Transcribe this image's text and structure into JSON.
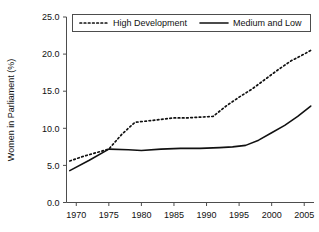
{
  "chart_data": {
    "type": "line",
    "title": "",
    "xlabel": "",
    "ylabel": "Women in Parliament (%)",
    "xlim": [
      1968.5,
      2006.5
    ],
    "ylim": [
      0.0,
      25.0
    ],
    "grid": false,
    "legend_position": "top",
    "x_ticks": [
      "1970",
      "1975",
      "1980",
      "1985",
      "1990",
      "1995",
      "2000",
      "2005"
    ],
    "x_tick_values": [
      1970,
      1975,
      1980,
      1985,
      1990,
      1995,
      2000,
      2005
    ],
    "y_ticks": [
      "0.0",
      "5.0",
      "10.0",
      "15.0",
      "20.0",
      "25.0"
    ],
    "y_tick_values": [
      0.0,
      5.0,
      10.0,
      15.0,
      20.0,
      25.0
    ],
    "series": [
      {
        "name": "High Development",
        "style": "dotted",
        "color": "#111111",
        "x": [
          1969,
          1971,
          1973,
          1975,
          1977,
          1979,
          1981,
          1983,
          1985,
          1987,
          1989,
          1991,
          1993,
          1995,
          1997,
          1999,
          2001,
          2003,
          2005,
          2006
        ],
        "values": [
          5.6,
          6.2,
          6.7,
          7.2,
          9.2,
          10.8,
          11.0,
          11.2,
          11.4,
          11.4,
          11.5,
          11.6,
          13.0,
          14.2,
          15.3,
          16.6,
          17.9,
          19.1,
          20.0,
          20.5
        ]
      },
      {
        "name": "Medium and Low",
        "style": "solid",
        "color": "#111111",
        "x": [
          1969,
          1972,
          1975,
          1978,
          1980,
          1983,
          1986,
          1989,
          1992,
          1994,
          1996,
          1998,
          2000,
          2002,
          2004,
          2006
        ],
        "values": [
          4.3,
          5.7,
          7.2,
          7.1,
          7.0,
          7.2,
          7.3,
          7.3,
          7.4,
          7.5,
          7.7,
          8.4,
          9.4,
          10.4,
          11.6,
          13.0
        ]
      }
    ],
    "legend": [
      {
        "label": "High Development",
        "style": "dotted"
      },
      {
        "label": "Medium and Low",
        "style": "solid"
      }
    ]
  }
}
